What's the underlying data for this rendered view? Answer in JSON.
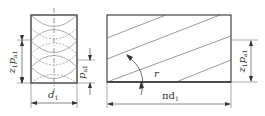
{
  "diagram": {
    "left_view": {
      "width_label": "d",
      "width_sub": "1",
      "height_label": "z",
      "height_sub": "1",
      "height_label2": "p",
      "height_sub2": "a1",
      "pitch_label": "p",
      "pitch_sub": "a1"
    },
    "right_view": {
      "width_label": "πd",
      "width_sub": "1",
      "angle_label": "r",
      "height_label": "z",
      "height_sub": "1",
      "height_label2": "p",
      "height_sub2": "a1"
    },
    "colors": {
      "line": "#333333",
      "thin": "#666666"
    }
  }
}
